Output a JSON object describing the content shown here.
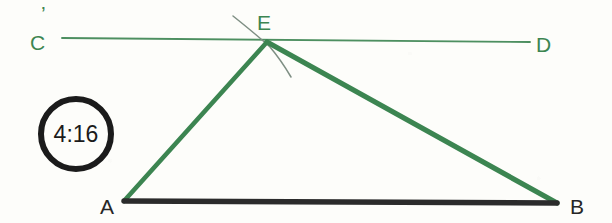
{
  "canvas": {
    "width": 612,
    "height": 223,
    "background": "#fdfdfa"
  },
  "colors": {
    "green": "#3c8551",
    "green_thin": "#4d8f60",
    "dark": "#2b2b2b",
    "arc_gray": "#7f8f84",
    "badge_ring": "#1b1b1b",
    "badge_text": "#1b1b1b"
  },
  "badge": {
    "name": "timestamp-badge",
    "text": "4:16",
    "cx": 76,
    "cy": 134,
    "r": 38,
    "ring_width": 6
  },
  "labels": {
    "c": "C",
    "d": "D",
    "e": "E",
    "a": "A",
    "b": "B",
    "c_tick": "’"
  },
  "label_positions": {
    "c": {
      "x": 30,
      "y": 50
    },
    "d": {
      "x": 536,
      "y": 52
    },
    "e": {
      "x": 257,
      "y": 30
    },
    "a": {
      "x": 100,
      "y": 214
    },
    "b": {
      "x": 570,
      "y": 214
    },
    "c_tick": {
      "x": 41,
      "y": 21
    }
  },
  "points": {
    "C": {
      "x": 62,
      "y": 38
    },
    "D": {
      "x": 530,
      "y": 42
    },
    "E": {
      "x": 267,
      "y": 42
    },
    "A": {
      "x": 124,
      "y": 201
    },
    "B": {
      "x": 557,
      "y": 203
    }
  },
  "segments": [
    {
      "name": "line-cd",
      "from": "C",
      "to": "D",
      "color": "#4d8f60",
      "width": 1.9,
      "style": "thin-green"
    },
    {
      "name": "line-ea",
      "from": "E",
      "to": "A",
      "color": "#3c8551",
      "width": 4.6,
      "style": "thick-green"
    },
    {
      "name": "line-eb",
      "from": "E",
      "to": "B",
      "color": "#3c8551",
      "width": 5.2,
      "style": "thick-green"
    },
    {
      "name": "line-ab",
      "from": "A",
      "to": "B",
      "color": "#2b2b2b",
      "width": 5.4,
      "style": "thick-dark"
    }
  ],
  "arc_through_e": {
    "name": "construction-arc",
    "d": "M 233 16 Q 258 36 270 47 Q 281 60 291 77",
    "color": "#7f8f84",
    "width": 1.5
  },
  "figure": {
    "type": "geometry-diagram"
  }
}
